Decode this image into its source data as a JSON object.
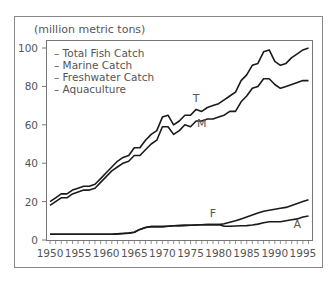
{
  "chart_data": {
    "type": "line",
    "title": "",
    "ylabel": "(million metric tons)",
    "xlabel": "",
    "xlim": [
      1950,
      1996
    ],
    "ylim": [
      0,
      100
    ],
    "x_ticks": [
      1950,
      1955,
      1960,
      1965,
      1970,
      1975,
      1980,
      1985,
      1990,
      1995
    ],
    "y_ticks": [
      0,
      20,
      40,
      60,
      80,
      100
    ],
    "grid": false,
    "legend": {
      "position": "top-left",
      "entries": [
        "– Total Fish Catch",
        "– Marine Catch",
        "– Freshwater Catch",
        "– Aquaculture"
      ]
    },
    "x": [
      1950,
      1951,
      1952,
      1953,
      1954,
      1955,
      1956,
      1957,
      1958,
      1959,
      1960,
      1961,
      1962,
      1963,
      1964,
      1965,
      1966,
      1967,
      1968,
      1969,
      1970,
      1971,
      1972,
      1973,
      1974,
      1975,
      1976,
      1977,
      1978,
      1979,
      1980,
      1981,
      1982,
      1983,
      1984,
      1985,
      1986,
      1987,
      1988,
      1989,
      1990,
      1991,
      1992,
      1993,
      1994,
      1995,
      1996
    ],
    "series": [
      {
        "name": "Total Fish Catch",
        "label": "T",
        "values": [
          20,
          22,
          24,
          24,
          26,
          27,
          28,
          28,
          29,
          32,
          35,
          38,
          41,
          43,
          44,
          48,
          48,
          52,
          55,
          57,
          64,
          65,
          60,
          62,
          65,
          65,
          68,
          67,
          69,
          70,
          71,
          73,
          75,
          77,
          83,
          86,
          91,
          92,
          98,
          99,
          93,
          91,
          92,
          95,
          97,
          99,
          100
        ]
      },
      {
        "name": "Marine Catch",
        "label": "M",
        "values": [
          18,
          20,
          22,
          22,
          24,
          25,
          26,
          26,
          27,
          30,
          33,
          36,
          38,
          40,
          41,
          44,
          44,
          47,
          50,
          52,
          59,
          59,
          55,
          57,
          60,
          59,
          62,
          62,
          63,
          63,
          64,
          65,
          67,
          67,
          72,
          75,
          79,
          80,
          84,
          84,
          81,
          79,
          80,
          81,
          82,
          83,
          83
        ]
      },
      {
        "name": "Freshwater Catch",
        "label": "F",
        "values": [
          3,
          3,
          3,
          3,
          3,
          3,
          3,
          3,
          3,
          3,
          3,
          3,
          3.2,
          3.4,
          3.6,
          4,
          5.5,
          6.5,
          7,
          7,
          7,
          7.2,
          7.4,
          7.5,
          7.6,
          7.7,
          7.8,
          7.9,
          8,
          8,
          8,
          8.5,
          9.2,
          10,
          11,
          12,
          13,
          14,
          15,
          15.5,
          16,
          16.5,
          17,
          18,
          19,
          20,
          21
        ]
      },
      {
        "name": "Aquaculture",
        "label": "A",
        "values": [
          3,
          3,
          3,
          3,
          3,
          3,
          3,
          3,
          3,
          3,
          3,
          3,
          3.2,
          3.4,
          3.6,
          4,
          5.5,
          6.5,
          7,
          7,
          7,
          7.2,
          7.4,
          7.5,
          7.6,
          7.7,
          7.8,
          7.9,
          8,
          8,
          8,
          7.2,
          7.2,
          7.3,
          7.4,
          7.5,
          7.8,
          8.3,
          9,
          9.5,
          9.5,
          9.5,
          10,
          10.5,
          11,
          12,
          12.5
        ]
      }
    ],
    "annotations": [
      {
        "text": "T",
        "x": 1976,
        "y": 72
      },
      {
        "text": "M",
        "x": 1977,
        "y": 59
      },
      {
        "text": "F",
        "x": 1979,
        "y": 12
      },
      {
        "text": "A",
        "x": 1994,
        "y": 6
      }
    ]
  },
  "labels": {
    "unit": "(million metric tons)",
    "legend": [
      "– Total Fish Catch",
      "– Marine Catch",
      "– Freshwater Catch",
      "– Aquaculture"
    ],
    "series_tags": {
      "T": "T",
      "M": "M",
      "F": "F",
      "A": "A"
    }
  }
}
